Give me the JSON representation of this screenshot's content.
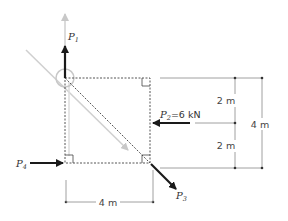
{
  "diagram": {
    "type": "statics-force-diagram",
    "structure": "square frame with four forces at corners/side",
    "colors": {
      "force_arrow": "#1a1a1a",
      "construction_line": "#c8c8c8",
      "frame_dotted": "#555555",
      "dimension_line": "#888888"
    },
    "forces": [
      {
        "id": "P1",
        "label_main": "P",
        "label_sub": "1",
        "direction": "up",
        "location": "top-left corner"
      },
      {
        "id": "P2",
        "label_main": "P",
        "label_sub": "2",
        "value_text": "=6 kN",
        "direction": "left",
        "location": "right side midpoint"
      },
      {
        "id": "P3",
        "label_main": "P",
        "label_sub": "3",
        "direction": "down-right (diagonal)",
        "location": "bottom-right corner"
      },
      {
        "id": "P4",
        "label_main": "P",
        "label_sub": "4",
        "direction": "right",
        "location": "bottom-left corner"
      }
    ],
    "dimensions": {
      "horizontal": "4 m",
      "vertical_total": "4 m",
      "vertical_upper": "2 m",
      "vertical_lower": "2 m"
    }
  }
}
